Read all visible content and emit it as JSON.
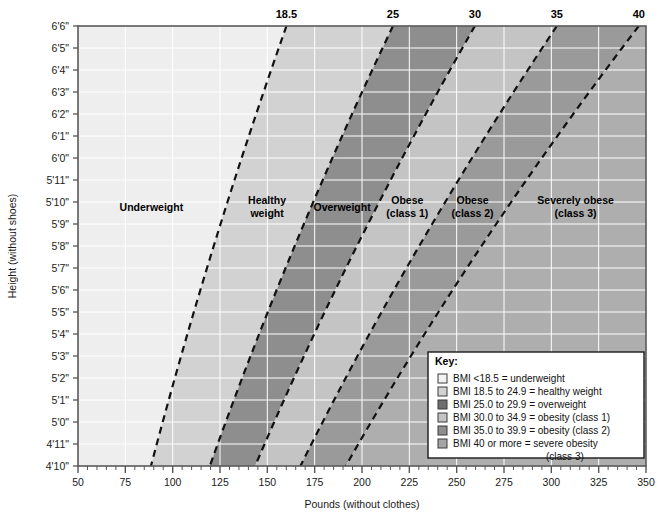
{
  "chart_data": {
    "type": "area",
    "title": "",
    "xlabel": "Pounds (without clothes)",
    "ylabel": "Height (without shoes)",
    "xlim": [
      50,
      350
    ],
    "ylim_inches": [
      58,
      78
    ],
    "grid": true,
    "x_ticks": [
      "50",
      "75",
      "100",
      "125",
      "150",
      "175",
      "200",
      "225",
      "250",
      "275",
      "300",
      "325",
      "350"
    ],
    "x_tick_values": [
      50,
      75,
      100,
      125,
      150,
      175,
      200,
      225,
      250,
      275,
      300,
      325,
      350
    ],
    "x_minor_step": 5,
    "y_ticks": [
      "6'6\"",
      "6'5\"",
      "6'4\"",
      "6'3\"",
      "6'2\"",
      "6'1\"",
      "6'0\"",
      "5'11\"",
      "5'10\"",
      "5'9\"",
      "5'8\"",
      "5'7\"",
      "5'6\"",
      "5'5\"",
      "5'4\"",
      "5'3\"",
      "5'2\"",
      "5'1\"",
      "5'0\"",
      "4'11\"",
      "4'10\""
    ],
    "y_tick_inches": [
      78,
      77,
      76,
      75,
      74,
      73,
      72,
      71,
      70,
      69,
      68,
      67,
      66,
      65,
      64,
      63,
      62,
      61,
      60,
      59,
      58
    ],
    "top_ticks": [
      "18.5",
      "25",
      "30",
      "35",
      "40"
    ],
    "top_tick_values": [
      18.5,
      25,
      30,
      35,
      40
    ],
    "bmi_boundaries": [
      18.5,
      25,
      30,
      35,
      40
    ],
    "bands": [
      {
        "name": "Underweight",
        "label_lines": [
          "Underweight"
        ],
        "bmi_min": 0,
        "bmi_max": 18.5,
        "color": "#eeeeee"
      },
      {
        "name": "Healthy weight",
        "label_lines": [
          "Healthy",
          "weight"
        ],
        "bmi_min": 18.5,
        "bmi_max": 25,
        "color": "#d2d2d2"
      },
      {
        "name": "Overweight",
        "label_lines": [
          "Overweight"
        ],
        "bmi_min": 25,
        "bmi_max": 30,
        "color": "#8e8e8e"
      },
      {
        "name": "Obese (class 1)",
        "label_lines": [
          "Obese",
          "(class 1)"
        ],
        "bmi_min": 30,
        "bmi_max": 35,
        "color": "#c4c4c4"
      },
      {
        "name": "Obese (class 2)",
        "label_lines": [
          "Obese",
          "(class 2)"
        ],
        "bmi_min": 35,
        "bmi_max": 40,
        "color": "#9a9a9a"
      },
      {
        "name": "Severely obese (class 3)",
        "label_lines": [
          "Severely obese",
          "(class 3)"
        ],
        "bmi_min": 40,
        "bmi_max": 100,
        "color": "#aeaeae"
      }
    ]
  },
  "axes": {
    "x_title": "Pounds (without clothes)",
    "y_title": "Height (without shoes)",
    "top_labels": [
      "18.5",
      "25",
      "30",
      "35",
      "40"
    ],
    "x_labels": [
      "50",
      "75",
      "100",
      "125",
      "150",
      "175",
      "200",
      "225",
      "250",
      "275",
      "300",
      "325",
      "350"
    ],
    "y_labels": [
      "6'6\"",
      "6'5\"",
      "6'4\"",
      "6'3\"",
      "6'2\"",
      "6'1\"",
      "6'0\"",
      "5'11\"",
      "5'10\"",
      "5'9\"",
      "5'8\"",
      "5'7\"",
      "5'6\"",
      "5'5\"",
      "5'4\"",
      "5'3\"",
      "5'2\"",
      "5'1\"",
      "5'0\"",
      "4'11\"",
      "4'10\""
    ]
  },
  "band_labels": [
    {
      "lines": [
        "Underweight"
      ]
    },
    {
      "lines": [
        "Healthy",
        "weight"
      ]
    },
    {
      "lines": [
        "Overweight"
      ]
    },
    {
      "lines": [
        "Obese",
        "(class 1)"
      ]
    },
    {
      "lines": [
        "Obese",
        "(class 2)"
      ]
    },
    {
      "lines": [
        "Severely obese",
        "(class 3)"
      ]
    }
  ],
  "legend": {
    "title": "Key:",
    "items": [
      {
        "swatch": "#f2f2f2",
        "text": "BMI <18.5 = underweight"
      },
      {
        "swatch": "#d2d2d2",
        "text": "BMI 18.5 to 24.9 = healthy weight"
      },
      {
        "swatch": "#6e6e6e",
        "text": "BMI 25.0 to 29.9 = overweight"
      },
      {
        "swatch": "#c4c4c4",
        "text": "BMI 30.0 to 34.9 = obesity (class 1)"
      },
      {
        "swatch": "#8e8e8e",
        "text": "BMI 35.0 to 39.9 = obesity (class 2)"
      },
      {
        "swatch": "#a5a5a5",
        "text": "BMI 40 or more = severe obesity"
      }
    ],
    "continuation": "(class 3)"
  },
  "colors": {
    "underweight": "#eeeeee",
    "healthy": "#d2d2d2",
    "overweight": "#8e8e8e",
    "obese1": "#c4c4c4",
    "obese2": "#9a9a9a",
    "obese3": "#aeaeae",
    "grid": "#ffffff",
    "axis": "#555555",
    "plot_border": "#5a5a5a"
  }
}
